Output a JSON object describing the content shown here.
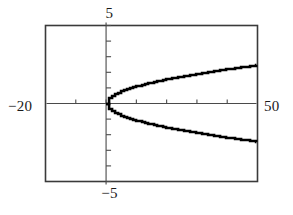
{
  "figure": {
    "name": "calculator-parabola-plot",
    "background_color": "#ffffff",
    "frame_color": "#3a3a3a",
    "axis_color": "#4a4a4a",
    "curve_color": "#000000"
  },
  "labels": {
    "top": "5",
    "bottom": "−5",
    "left": "−20",
    "right": "50"
  },
  "chart_data": {
    "type": "line",
    "title": "",
    "xlabel": "",
    "ylabel": "",
    "xlim": [
      -20,
      50
    ],
    "ylim": [
      -5,
      5
    ],
    "grid": false,
    "legend": false,
    "x_tick_labels": [
      "−20",
      "50"
    ],
    "y_tick_labels": [
      "−5",
      "5"
    ],
    "x_tick_interval": 10,
    "y_tick_interval": 1,
    "x_ticks": [
      -20,
      -10,
      0,
      10,
      20,
      30,
      40,
      50
    ],
    "y_ticks": [
      -5,
      -4,
      -3,
      -2,
      -1,
      0,
      1,
      2,
      3,
      4,
      5
    ],
    "render_style": "stair-stepped",
    "series": [
      {
        "name": "upper branch",
        "x": [
          0,
          1,
          2,
          3,
          4,
          5,
          6,
          7,
          8,
          9,
          10,
          12,
          14,
          16,
          18,
          20,
          23,
          26,
          29,
          32,
          35,
          38,
          41,
          44,
          47,
          50
        ],
        "values": [
          0,
          1.0,
          1.41,
          1.73,
          2.0,
          2.24,
          2.45,
          2.65,
          2.83,
          3.0,
          3.16,
          3.46,
          3.74,
          4.0,
          4.24,
          4.47,
          4.8,
          5.1,
          5.39,
          5.66,
          5.92,
          6.16,
          6.4,
          6.63,
          6.86,
          7.07
        ]
      },
      {
        "name": "lower branch",
        "x": [
          0,
          1,
          2,
          3,
          4,
          5,
          6,
          7,
          8,
          9,
          10,
          12,
          14,
          16,
          18,
          20,
          23,
          26,
          29,
          32,
          35,
          38,
          41,
          44,
          47,
          50
        ],
        "values": [
          0,
          -1.0,
          -1.41,
          -1.73,
          -2.0,
          -2.24,
          -2.45,
          -2.65,
          -2.83,
          -3.0,
          -3.16,
          -3.46,
          -3.74,
          -4.0,
          -4.24,
          -4.47,
          -4.8,
          -5.1,
          -5.39,
          -5.66,
          -5.92,
          -6.16,
          -6.4,
          -6.63,
          -6.86,
          -7.07
        ]
      }
    ],
    "curve_top_endpoint": {
      "x": 50,
      "y": 2.45
    },
    "curve_bottom_endpoint": {
      "x": 50,
      "y": -2.6
    },
    "vertex": {
      "x": 0,
      "y": 0
    },
    "annotations": []
  }
}
